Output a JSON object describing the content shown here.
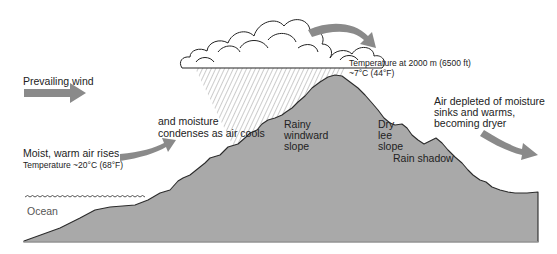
{
  "diagram": {
    "colors": {
      "mountain_fill": "#a9a9a9",
      "mountain_outline": "#2b2b2b",
      "arrow_fill": "#8a8a8a",
      "cloud_fill": "#ffffff",
      "cloud_outline": "#222222",
      "rain_hatch": "#555555",
      "ocean_wave": "#444444"
    },
    "labels": {
      "prevailing_wind": "Prevailing wind",
      "moist_air_line1": "Moist, warm air rises",
      "moist_air_line2": "Temperature ~20°C (68°F)",
      "condenses_line1": "and moisture",
      "condenses_line2": "condenses as air cools",
      "temp_top_line1": "Temperature at 2000 m (6500 ft)",
      "temp_top_line2": "~7°C (44°F)",
      "windward_line1": "Rainy",
      "windward_line2": "windward",
      "windward_line3": "slope",
      "lee_line1": "Dry",
      "lee_line2": "lee",
      "lee_line3": "slope",
      "rain_shadow": "Rain shadow",
      "depleted_line1": "Air depleted of moisture",
      "depleted_line2": "sinks and warms,",
      "depleted_line3": "becoming dryer",
      "ocean": "Ocean"
    },
    "arrows": [
      {
        "name": "prevailing-wind-arrow",
        "direction": "right"
      },
      {
        "name": "rising-air-arrow",
        "direction": "up-right"
      },
      {
        "name": "over-peak-arrow",
        "direction": "curve-down-right"
      },
      {
        "name": "sinking-air-arrow",
        "direction": "down-right"
      }
    ]
  }
}
